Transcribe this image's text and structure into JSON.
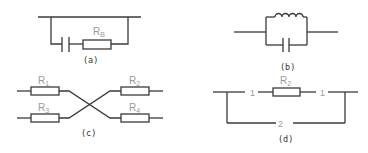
{
  "figure": {
    "panels": [
      {
        "id": "a",
        "caption": "(a)",
        "description": "Capacitor in series with resistor, both shunting a bus line",
        "components": [
          {
            "type": "capacitor",
            "label": ""
          },
          {
            "type": "resistor",
            "label": "R",
            "subscript": "B"
          }
        ]
      },
      {
        "id": "b",
        "caption": "(b)",
        "description": "Inductor in parallel with capacitor inserted in a line",
        "components": [
          {
            "type": "inductor",
            "label": ""
          },
          {
            "type": "capacitor",
            "label": ""
          }
        ]
      },
      {
        "id": "c",
        "caption": "(c)",
        "description": "Four resistors with crossed connections",
        "components": [
          {
            "type": "resistor",
            "label": "R",
            "subscript": "1"
          },
          {
            "type": "resistor",
            "label": "R",
            "subscript": "3"
          },
          {
            "type": "resistor",
            "label": "R",
            "subscript": "2"
          },
          {
            "type": "resistor",
            "label": "R",
            "subscript": "4"
          }
        ]
      },
      {
        "id": "d",
        "caption": "(d)",
        "description": "Resistor R2 on path 1 with a bypass path 2",
        "components": [
          {
            "type": "resistor",
            "label": "R",
            "subscript": "2"
          }
        ],
        "path_labels": [
          "1",
          "1",
          "2"
        ]
      }
    ]
  }
}
